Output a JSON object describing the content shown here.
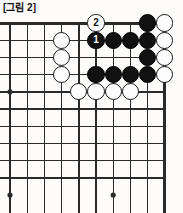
{
  "caption": {
    "text": "[그림 2]"
  },
  "board": {
    "type": "go-board-diagram",
    "description": "Corner go problem diagram showing the upper-right area of a go board",
    "grid": {
      "columns": 10,
      "rows": 10,
      "origin_x": 10,
      "origin_y": 6,
      "spacing": 17.2,
      "line_color": "#2a2a2a",
      "thin_line_width": 1.4,
      "edge_line_width": 3.0,
      "edges": [
        "top",
        "right"
      ],
      "board_background": "#fdfcfa"
    },
    "star_points": [
      {
        "col": 0,
        "row": 4
      },
      {
        "col": 0,
        "row": 10
      },
      {
        "col": 6,
        "row": 10
      }
    ],
    "star_point_radius": 2.6,
    "stone_radius": 8.6,
    "stones": [
      {
        "col": 8,
        "row": 0,
        "color": "black",
        "label": ""
      },
      {
        "col": 9,
        "row": 0,
        "color": "white",
        "label": ""
      },
      {
        "col": 5,
        "row": 0,
        "color": "white",
        "label": "2",
        "move": 2
      },
      {
        "col": 3,
        "row": 1,
        "color": "white",
        "label": ""
      },
      {
        "col": 5,
        "row": 1,
        "color": "black",
        "label": "1",
        "move": 1
      },
      {
        "col": 6,
        "row": 1,
        "color": "black",
        "label": ""
      },
      {
        "col": 7,
        "row": 1,
        "color": "black",
        "label": ""
      },
      {
        "col": 8,
        "row": 1,
        "color": "black",
        "label": ""
      },
      {
        "col": 9,
        "row": 1,
        "color": "white",
        "label": ""
      },
      {
        "col": 3,
        "row": 2,
        "color": "white",
        "label": ""
      },
      {
        "col": 8,
        "row": 2,
        "color": "black",
        "label": ""
      },
      {
        "col": 9,
        "row": 2,
        "color": "white",
        "label": ""
      },
      {
        "col": 3,
        "row": 3,
        "color": "white",
        "label": ""
      },
      {
        "col": 5,
        "row": 3,
        "color": "black",
        "label": ""
      },
      {
        "col": 6,
        "row": 3,
        "color": "black",
        "label": ""
      },
      {
        "col": 7,
        "row": 3,
        "color": "black",
        "label": ""
      },
      {
        "col": 8,
        "row": 3,
        "color": "black",
        "label": ""
      },
      {
        "col": 9,
        "row": 3,
        "color": "white",
        "label": ""
      },
      {
        "col": 4,
        "row": 4,
        "color": "white",
        "label": ""
      },
      {
        "col": 5,
        "row": 4,
        "color": "white",
        "label": ""
      },
      {
        "col": 6,
        "row": 4,
        "color": "white",
        "label": ""
      },
      {
        "col": 7,
        "row": 4,
        "color": "white",
        "label": ""
      }
    ],
    "colors": {
      "black_stone": "#111111",
      "white_stone": "#fdfdfd",
      "white_stone_border": "#1a1a1a",
      "black_label_text": "#ffffff",
      "white_label_text": "#111111"
    }
  }
}
